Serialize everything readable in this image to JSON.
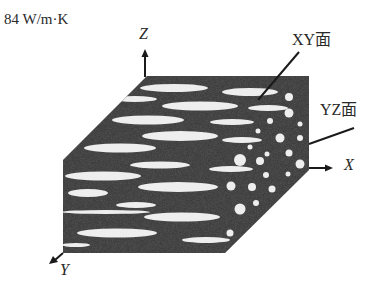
{
  "header": {
    "conductivity_value": "84 W/m·K"
  },
  "axes": {
    "z_label": "Z",
    "x_label": "X",
    "y_label": "Y"
  },
  "faces": {
    "xy_label": "XY面",
    "yz_label": "YZ面"
  },
  "colors": {
    "block": "#333333",
    "inclusion": "#eeeeee",
    "line": "#1a1a1a",
    "text": "#2a2a2a"
  },
  "block": {
    "description": "Composite block with elongated inclusions on XY and XZ faces and circular cross-sections on YZ face"
  }
}
